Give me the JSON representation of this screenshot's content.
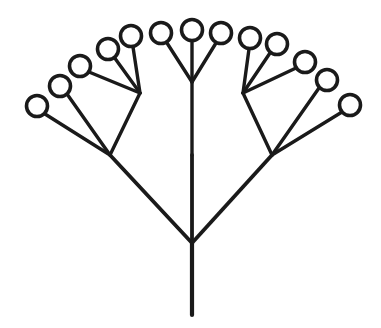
{
  "figure": {
    "name": "fractal-tree-diagram",
    "background_color": "#ffffff",
    "stroke_color": "#1a1a1a",
    "node_fill_color": "#ffffff",
    "canvas": {
      "width": 381,
      "height": 328
    }
  },
  "geometry": {
    "trunk_stroke_width": 4.2,
    "branch_stroke_width": 3.8,
    "twig_stroke_width": 3.4,
    "node_radius": 10.5,
    "node_stroke_width": 3.6
  },
  "tree": {
    "root": {
      "x": 192,
      "y": 315
    },
    "trunk_top": {
      "x": 192,
      "y": 243
    },
    "level1_junctions": [
      {
        "id": "L1-left",
        "x": 110,
        "y": 155
      },
      {
        "id": "L1-center",
        "x": 192,
        "y": 155
      },
      {
        "id": "L1-right",
        "x": 272,
        "y": 155
      }
    ],
    "level2_junctions": [
      {
        "id": "L2-left",
        "x": 140,
        "y": 93
      },
      {
        "id": "L2-center",
        "x": 192,
        "y": 82
      },
      {
        "id": "L2-right",
        "x": 243,
        "y": 93
      }
    ],
    "branches_level1": [
      {
        "from": "trunk_top",
        "to": "L1-left"
      },
      {
        "from": "trunk_top",
        "to": "L1-center"
      },
      {
        "from": "trunk_top",
        "to": "L1-right"
      }
    ],
    "branches_level2": [
      {
        "from": "L1-left",
        "to": "L2-left"
      },
      {
        "from": "L1-center",
        "to": "L2-center"
      },
      {
        "from": "L1-right",
        "to": "L2-right"
      }
    ],
    "terminal_nodes": [
      {
        "id": "leaf-1",
        "parent": "L1-left",
        "x": 37,
        "y": 106
      },
      {
        "id": "leaf-2",
        "parent": "L1-left",
        "x": 60,
        "y": 86
      },
      {
        "id": "leaf-3",
        "parent": "L2-left",
        "x": 80,
        "y": 66
      },
      {
        "id": "leaf-4",
        "parent": "L2-left",
        "x": 108,
        "y": 49
      },
      {
        "id": "leaf-5",
        "parent": "L2-left",
        "x": 131,
        "y": 36
      },
      {
        "id": "leaf-6",
        "parent": "L2-center",
        "x": 161,
        "y": 33
      },
      {
        "id": "leaf-7",
        "parent": "L2-center",
        "x": 192,
        "y": 30
      },
      {
        "id": "leaf-8",
        "parent": "L2-center",
        "x": 221,
        "y": 33
      },
      {
        "id": "leaf-9",
        "parent": "L2-right",
        "x": 250,
        "y": 38
      },
      {
        "id": "leaf-10",
        "parent": "L2-right",
        "x": 277,
        "y": 44
      },
      {
        "id": "leaf-11",
        "parent": "L2-right",
        "x": 305,
        "y": 62
      },
      {
        "id": "leaf-12",
        "parent": "L1-right",
        "x": 327,
        "y": 80
      },
      {
        "id": "leaf-13",
        "parent": "L1-right",
        "x": 350,
        "y": 105
      }
    ],
    "twig_segments": [
      {
        "from_x": 110,
        "from_y": 155,
        "to_x": 45,
        "to_y": 114,
        "leaf": "leaf-1"
      },
      {
        "from_x": 110,
        "from_y": 155,
        "to_x": 67,
        "to_y": 94,
        "leaf": "leaf-2"
      },
      {
        "from_x": 110,
        "from_y": 155,
        "to_x": 140,
        "to_y": 93,
        "leaf": null
      },
      {
        "from_x": 140,
        "from_y": 93,
        "to_x": 89,
        "to_y": 72,
        "leaf": "leaf-3"
      },
      {
        "from_x": 140,
        "from_y": 93,
        "to_x": 114,
        "to_y": 57,
        "leaf": "leaf-4"
      },
      {
        "from_x": 140,
        "from_y": 93,
        "to_x": 133,
        "to_y": 47,
        "leaf": "leaf-5"
      },
      {
        "from_x": 192,
        "from_y": 155,
        "to_x": 192,
        "to_y": 82,
        "leaf": null
      },
      {
        "from_x": 192,
        "from_y": 82,
        "to_x": 167,
        "to_y": 43,
        "leaf": "leaf-6"
      },
      {
        "from_x": 192,
        "from_y": 82,
        "to_x": 192,
        "to_y": 41,
        "leaf": "leaf-7"
      },
      {
        "from_x": 192,
        "from_y": 82,
        "to_x": 216,
        "to_y": 43,
        "leaf": "leaf-8"
      },
      {
        "from_x": 243,
        "from_y": 93,
        "to_x": 249,
        "to_y": 49,
        "leaf": "leaf-9"
      },
      {
        "from_x": 243,
        "from_y": 93,
        "to_x": 270,
        "to_y": 53,
        "leaf": "leaf-10"
      },
      {
        "from_x": 243,
        "from_y": 93,
        "to_x": 296,
        "to_y": 68,
        "leaf": "leaf-11"
      },
      {
        "from_x": 272,
        "from_y": 155,
        "to_x": 243,
        "to_y": 93,
        "leaf": null
      },
      {
        "from_x": 272,
        "from_y": 155,
        "to_x": 319,
        "to_y": 88,
        "leaf": "leaf-12"
      },
      {
        "from_x": 272,
        "from_y": 155,
        "to_x": 342,
        "to_y": 112,
        "leaf": "leaf-13"
      }
    ],
    "counts": {
      "terminal_nodes": 13,
      "levels": 3
    }
  }
}
